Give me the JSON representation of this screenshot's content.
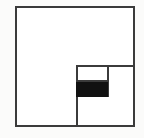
{
  "figure": {
    "type": "geometric-diagram",
    "canvas": {
      "width": 144,
      "height": 138,
      "background_color": "#fbfbfa"
    },
    "colors": {
      "stroke": "#3b3b3b",
      "stroke_light": "#6e6e6e",
      "fill_shaded": "#111111",
      "fill_empty": "#ffffff",
      "background": "#fbfbfa"
    },
    "stroke_width": 2,
    "shapes": [
      {
        "name": "outer-square",
        "label": "Outer square",
        "kind": "rect",
        "x": 15,
        "y": 6,
        "width": 120,
        "height": 121,
        "fill": "#ffffff",
        "stroke": "#3b3b3b",
        "stroke_width": 2
      },
      {
        "name": "inner-square",
        "label": "Inner square (lower-right quadrant)",
        "kind": "rect",
        "x": 76,
        "y": 65,
        "width": 59,
        "height": 62,
        "fill": "#ffffff",
        "stroke": "#3b3b3b",
        "stroke_width": 2
      },
      {
        "name": "inner-divider-line",
        "label": "Vertical divider inside inner square",
        "kind": "line",
        "x1": 108,
        "y1": 65,
        "x2": 108,
        "y2": 97,
        "stroke": "#3b3b3b",
        "stroke_width": 2
      },
      {
        "name": "shaded-rectangle",
        "label": "Black filled rectangle",
        "kind": "rect",
        "x": 76,
        "y": 81,
        "width": 32,
        "height": 16,
        "fill": "#111111",
        "stroke": "#111111",
        "stroke_width": 1
      },
      {
        "name": "shaded-rect-top-line",
        "label": "Top boundary of shaded rectangle",
        "kind": "line",
        "x1": 76,
        "y1": 81,
        "x2": 108,
        "y2": 81,
        "stroke": "#3b3b3b",
        "stroke_width": 2
      }
    ],
    "annotations": {
      "labels": [],
      "caption": ""
    }
  }
}
